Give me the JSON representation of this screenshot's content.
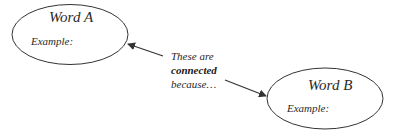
{
  "diagram": {
    "node_a": {
      "title": "Word A",
      "example_label": "Example:"
    },
    "node_b": {
      "title": "Word B",
      "example_label": "Example:"
    },
    "connector_text": {
      "line1": "These are",
      "line2": "connected",
      "line3": "because…"
    },
    "colors": {
      "stroke": "#333333",
      "text": "#2a2a2a",
      "background": "#ffffff"
    }
  }
}
